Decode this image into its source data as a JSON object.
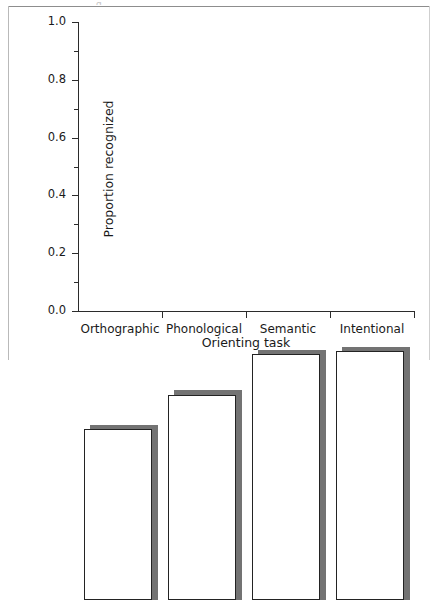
{
  "figure": {
    "caption_rule_visible": true,
    "page_frame_visible": true,
    "truncated_caption_glyph": "g"
  },
  "chart_data": {
    "type": "bar",
    "title": "",
    "subtitle": "",
    "xlabel": "Orienting task",
    "ylabel": "Proportion recognized",
    "categories": [
      "Orthographic",
      "Phonological",
      "Semantic",
      "Intentional"
    ],
    "values": [
      0.59,
      0.71,
      0.85,
      0.86
    ],
    "shadow_values": [
      0.605,
      0.725,
      0.865,
      0.875
    ],
    "ylim": [
      0.0,
      1.0
    ],
    "xlim_categories": 4,
    "ytick_labels": [
      "0.0",
      "0.2",
      "0.4",
      "0.6",
      "0.8",
      "1.0"
    ],
    "ytick_values": [
      0.0,
      0.2,
      0.4,
      0.6,
      0.8,
      1.0
    ],
    "yminor_tick_values": [
      0.1,
      0.3,
      0.5,
      0.7,
      0.9
    ],
    "grid": false,
    "legend": null,
    "legend_position": "none",
    "annotations": [],
    "series": [
      {
        "name": "Proportion recognized",
        "values": [
          0.59,
          0.71,
          0.85,
          0.86
        ]
      }
    ],
    "colors": {
      "bar_face": "#ffffff",
      "bar_outline": "#232323",
      "bar_shadow": "#737373",
      "axis": "#2b2b2b",
      "text": "#1a1a1a",
      "page_rule": "#8d8d8d",
      "page_border": "#b9b9b9"
    }
  }
}
